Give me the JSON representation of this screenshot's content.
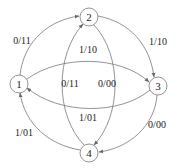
{
  "diagram": {
    "type": "state-transition",
    "nodes": [
      {
        "id": "1",
        "label": "1",
        "x": 19,
        "y": 84
      },
      {
        "id": "2",
        "label": "2",
        "x": 89,
        "y": 17
      },
      {
        "id": "3",
        "label": "3",
        "x": 158,
        "y": 86
      },
      {
        "id": "4",
        "label": "4",
        "x": 89,
        "y": 153
      }
    ],
    "edges": [
      {
        "from": "1",
        "to": "2",
        "label": "0/11"
      },
      {
        "from": "2",
        "to": "3",
        "label": "1/10"
      },
      {
        "from": "3",
        "to": "4",
        "label": "0/00"
      },
      {
        "from": "4",
        "to": "1",
        "label": "1/01"
      },
      {
        "from": "1",
        "to": "3",
        "label": "1/10"
      },
      {
        "from": "3",
        "to": "1",
        "label": "1/01"
      },
      {
        "from": "4",
        "to": "2",
        "label": "0/11"
      },
      {
        "from": "2",
        "to": "4",
        "label": "0/00"
      }
    ]
  }
}
